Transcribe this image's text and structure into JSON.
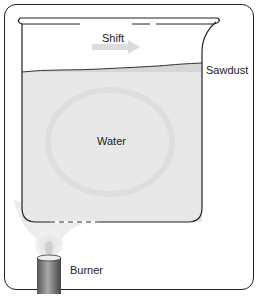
{
  "diagram": {
    "labels": {
      "shift": "Shift",
      "sawdust": "Sawdust",
      "water": "Water",
      "burner": "Burner"
    },
    "colors": {
      "water": "#e6e6e6",
      "sawdust_layer": "#d8d8d8",
      "outline": "#222222",
      "arrow": "#dcdcdc",
      "flame": "#f0f0f0",
      "burner": "#777777"
    }
  }
}
